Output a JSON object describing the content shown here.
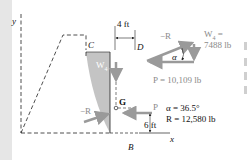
{
  "diagram": {
    "axes": {
      "y_label": "y",
      "x_label": "x"
    },
    "points": {
      "C": "C",
      "D": "D",
      "G": "G",
      "B": "B"
    },
    "dimensions": {
      "top_width": "4 ft",
      "height_to_P": "6 ft"
    },
    "forces": {
      "weight": "W",
      "weight_subscript": "4",
      "neg_R_body": "−R",
      "P_label": "P"
    },
    "triangle": {
      "neg_R": "−R",
      "alpha": "α",
      "W4_label": "W",
      "W4_subscript": "4",
      "W4_eq": " =",
      "W4_value": "7488 lb",
      "P_value": "P = 10,109 lb"
    },
    "results": {
      "alpha": "α = 36.5°",
      "R": "R = 12,580 lb"
    },
    "colors": {
      "shaded_region": "#c4c4c4",
      "force_arrow": "#9a9a9a",
      "line": "#222222",
      "gray_text": "#8a8a8a"
    }
  }
}
